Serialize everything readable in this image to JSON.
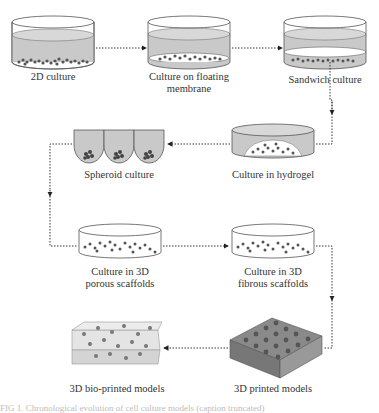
{
  "diagram": {
    "title": "Evolution of cell culture models",
    "nodes": [
      {
        "id": "2d",
        "label": "2D culture"
      },
      {
        "id": "floating",
        "label_line1": "Culture on floating",
        "label_line2": "membrane"
      },
      {
        "id": "sandwich",
        "label": "Sandwich culture"
      },
      {
        "id": "hydrogel",
        "label": "Culture in hydrogel"
      },
      {
        "id": "spheroid",
        "label": "Spheroid culture"
      },
      {
        "id": "porous",
        "label_line1": "Culture in 3D",
        "label_line2": "porous scaffolds"
      },
      {
        "id": "fibrous",
        "label_line1": "Culture in 3D",
        "label_line2": "fibrous scaffolds"
      },
      {
        "id": "printed",
        "label": "3D printed models"
      },
      {
        "id": "bioprinted",
        "label": "3D bio-printed models"
      }
    ],
    "edges": [
      [
        "2d",
        "floating"
      ],
      [
        "floating",
        "sandwich"
      ],
      [
        "sandwich",
        "hydrogel"
      ],
      [
        "hydrogel",
        "spheroid"
      ],
      [
        "spheroid",
        "porous"
      ],
      [
        "porous",
        "fibrous"
      ],
      [
        "fibrous",
        "printed"
      ],
      [
        "printed",
        "bioprinted"
      ]
    ],
    "caption": "FIG 1. Chronological evolution of cell culture models (caption truncated)"
  }
}
